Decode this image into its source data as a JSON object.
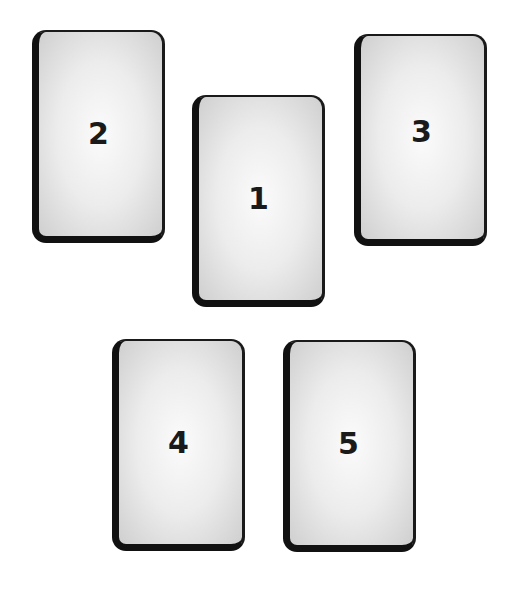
{
  "diagram": {
    "type": "card-spread-layout",
    "cards": [
      {
        "label": "1",
        "x": 192,
        "y": 95,
        "w": 133,
        "h": 212
      },
      {
        "label": "2",
        "x": 32,
        "y": 30,
        "w": 133,
        "h": 213
      },
      {
        "label": "3",
        "x": 354,
        "y": 34,
        "w": 133,
        "h": 212
      },
      {
        "label": "4",
        "x": 112,
        "y": 339,
        "w": 133,
        "h": 212
      },
      {
        "label": "5",
        "x": 283,
        "y": 340,
        "w": 133,
        "h": 212
      }
    ],
    "colors": {
      "background": "#ffffff",
      "card_border": "#111111",
      "card_fill_center": "#fbfbfb",
      "card_fill_edge": "#cfcfcf",
      "number": "#1a1a1a"
    }
  }
}
